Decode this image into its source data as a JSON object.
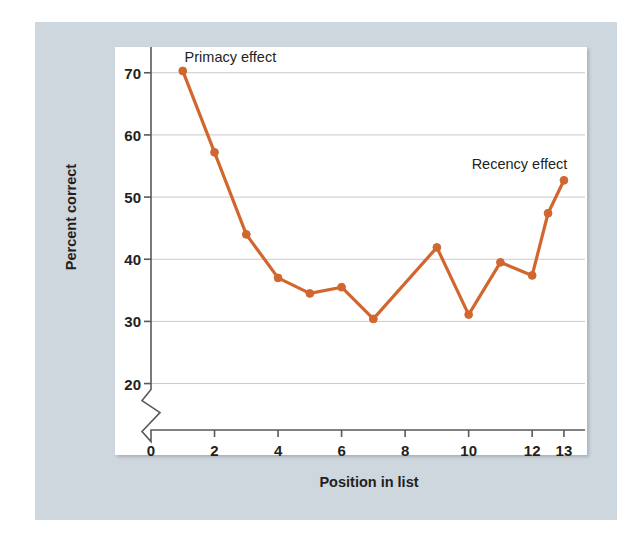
{
  "figure": {
    "background_color": "#ced6de",
    "panel_color": "#ffffff",
    "line_color": "#d1672f",
    "grid_color": "#c9c9c9",
    "axis_color": "#58595b",
    "text_color": "#231f20"
  },
  "chart_data": {
    "type": "line",
    "title": "",
    "xlabel": "Position in list",
    "ylabel": "Percent correct",
    "xlim": [
      0,
      13.6
    ],
    "ylim": [
      18.0,
      73.5
    ],
    "grid": true,
    "grid_axis": "y",
    "legend": "none",
    "y_axis_break": true,
    "y_axis_break_note": "zigzag break on y-axis between 0 and 20",
    "xticks": [
      0,
      2,
      4,
      6,
      8,
      10,
      12,
      13
    ],
    "xtick_labels": [
      "0",
      "2",
      "4",
      "6",
      "8",
      "10",
      "12",
      "13"
    ],
    "yticks": [
      20,
      30,
      40,
      50,
      60,
      70
    ],
    "ytick_labels": [
      "20",
      "30",
      "40",
      "50",
      "60",
      "70"
    ],
    "series": [
      {
        "name": "Percent correct",
        "color": "#d1672f",
        "x": [
          1,
          2,
          3,
          4,
          5,
          6,
          7,
          9,
          10,
          11,
          12,
          12.5,
          13
        ],
        "values": [
          70.3,
          57.2,
          44.0,
          37.0,
          34.5,
          35.5,
          30.4,
          41.9,
          31.1,
          39.5,
          37.4,
          47.4,
          52.7
        ]
      }
    ],
    "annotations": [
      {
        "text": "Primacy effect",
        "x": 2.5,
        "y": 72.6
      },
      {
        "text": "Recency effect",
        "x": 11.6,
        "y": 55.4
      }
    ]
  }
}
